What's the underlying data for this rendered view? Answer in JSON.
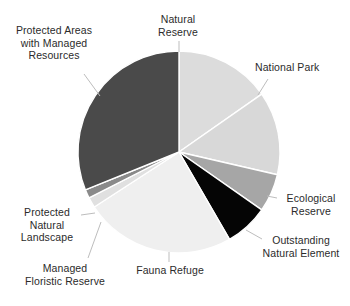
{
  "chart_data": {
    "type": "pie",
    "title": "",
    "subtitle": "",
    "xlabel": "",
    "ylabel": "",
    "grid": false,
    "legend_position": "none",
    "labels_position": "outside-with-leader-lines",
    "start_angle_deg": 0,
    "direction": "clockwise",
    "categories": [
      "Natural Reserve",
      "National Park",
      "Ecological Reserve",
      "Outstanding Natural Element",
      "Fauna Refuge",
      "Managed Floristic Reserve",
      "Protected Natural Landscape",
      "Protected Areas with Managed Resources"
    ],
    "values": [
      15.3,
      13.3,
      6.1,
      6.9,
      24.2,
      1.7,
      1.4,
      31.1
    ],
    "slices": [
      {
        "label": "Natural Reserve",
        "value": 15.3,
        "start_deg": 0,
        "end_deg": 55,
        "color": "#dcdcdc"
      },
      {
        "label": "National Park",
        "value": 13.3,
        "start_deg": 55,
        "end_deg": 103,
        "color": "#d8d8d8"
      },
      {
        "label": "Ecological Reserve",
        "value": 6.1,
        "start_deg": 103,
        "end_deg": 125,
        "color": "#a6a6a6"
      },
      {
        "label": "Outstanding Natural Element",
        "value": 6.9,
        "start_deg": 125,
        "end_deg": 150,
        "color": "#050505"
      },
      {
        "label": "Fauna Refuge",
        "value": 24.2,
        "start_deg": 150,
        "end_deg": 237,
        "color": "#efefef"
      },
      {
        "label": "Managed Floristic Reserve",
        "value": 1.7,
        "start_deg": 237,
        "end_deg": 243,
        "color": "#e0e0e0"
      },
      {
        "label": "Protected Natural Landscape",
        "value": 1.4,
        "start_deg": 243,
        "end_deg": 248,
        "color": "#8a8a8a"
      },
      {
        "label": "Protected Areas with Managed Resources",
        "value": 31.1,
        "start_deg": 248,
        "end_deg": 360,
        "color": "#4a4a4a"
      }
    ]
  },
  "labels": {
    "natural_reserve": "Natural\nReserve",
    "national_park": "National Park",
    "ecological_reserve": "Ecological\nReserve",
    "outstanding_natural_element": "Outstanding\nNatural Element",
    "fauna_refuge": "Fauna Refuge",
    "managed_floristic_reserve": "Managed\nFloristic Reserve",
    "protected_natural_landscape": "Protected\nNatural\nLandscape",
    "protected_areas_managed_resources": "Protected Areas\nwith Managed\nResources"
  },
  "colors": {
    "background": "#ffffff",
    "text": "#2b2b2b",
    "leader_line": "#bdbdbd",
    "slice_border": "#ffffff"
  }
}
